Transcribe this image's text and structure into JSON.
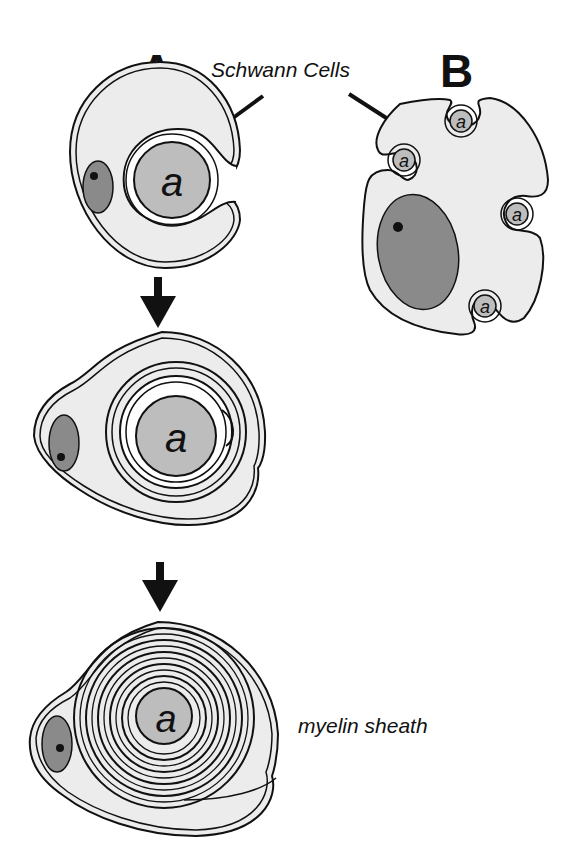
{
  "diagram": {
    "panels": [
      {
        "label": "A",
        "description": "Myelinating Schwann cell wrapping a single axon, three stages"
      },
      {
        "label": "B",
        "description": "Non-myelinating Schwann cell enclosing multiple axons"
      }
    ],
    "labels": {
      "schwann_cells": "Schwann Cells",
      "myelin_sheath": "myelin sheath",
      "axon": "a"
    },
    "colors": {
      "cytoplasm": "#ececec",
      "nucleus": "#8a8a8a",
      "axon": "#bdbdbd",
      "outline": "#111111",
      "background": "#ffffff"
    },
    "stages_panel_a": 3,
    "axons_panel_b": 5
  }
}
